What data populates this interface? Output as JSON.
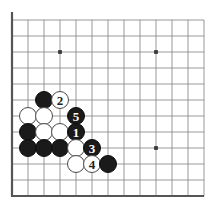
{
  "diagram": {
    "kind": "go-board-diagram",
    "board": {
      "grid_spacing": 16,
      "origin_x": 12,
      "origin_y": 20,
      "cols": 13,
      "rows": 12,
      "edges": {
        "left": true,
        "bottom": true,
        "top": false,
        "right": false
      },
      "line_color": "#8c8c8c",
      "edge_color": "#555555",
      "background": "#ffffff",
      "star_color": "#3a3a3a",
      "star_points": [
        {
          "col": 3,
          "row": 2
        },
        {
          "col": 9,
          "row": 2
        },
        {
          "col": 9,
          "row": 8
        }
      ]
    },
    "stone_radius": 9,
    "colors": {
      "black": "#1a1a1a",
      "white": "#ffffff",
      "white_outline": "#4a4a4a",
      "label_on_black": "#ffffff",
      "label_on_white": "#222222"
    },
    "stones": [
      {
        "id": "b-c2r5",
        "color": "black",
        "col": 2,
        "row": 5,
        "label": ""
      },
      {
        "id": "w-move2",
        "color": "white",
        "col": 3,
        "row": 5,
        "label": "2"
      },
      {
        "id": "w-c1r6",
        "color": "white",
        "col": 1,
        "row": 6,
        "label": ""
      },
      {
        "id": "w-c2r6",
        "color": "white",
        "col": 2,
        "row": 6,
        "label": ""
      },
      {
        "id": "b-move5",
        "color": "black",
        "col": 4,
        "row": 6,
        "label": "5"
      },
      {
        "id": "b-c1r7",
        "color": "black",
        "col": 1,
        "row": 7,
        "label": ""
      },
      {
        "id": "w-c2r7",
        "color": "white",
        "col": 2,
        "row": 7,
        "label": ""
      },
      {
        "id": "w-c3r7",
        "color": "white",
        "col": 3,
        "row": 7,
        "label": ""
      },
      {
        "id": "b-move1",
        "color": "black",
        "col": 4,
        "row": 7,
        "label": "1"
      },
      {
        "id": "b-c1r8",
        "color": "black",
        "col": 1,
        "row": 8,
        "label": ""
      },
      {
        "id": "b-c2r8",
        "color": "black",
        "col": 2,
        "row": 8,
        "label": ""
      },
      {
        "id": "b-c3r8",
        "color": "black",
        "col": 3,
        "row": 8,
        "label": ""
      },
      {
        "id": "w-c4r8",
        "color": "white",
        "col": 4,
        "row": 8,
        "label": ""
      },
      {
        "id": "b-move3",
        "color": "black",
        "col": 5,
        "row": 8,
        "label": "3"
      },
      {
        "id": "w-c4r9",
        "color": "white",
        "col": 4,
        "row": 9,
        "label": ""
      },
      {
        "id": "w-move4",
        "color": "white",
        "col": 5,
        "row": 9,
        "label": "4"
      },
      {
        "id": "b-c6r9",
        "color": "black",
        "col": 6,
        "row": 9,
        "label": ""
      }
    ],
    "move_sequence": [
      {
        "number": "1",
        "color": "black"
      },
      {
        "number": "2",
        "color": "white"
      },
      {
        "number": "3",
        "color": "black"
      },
      {
        "number": "4",
        "color": "white"
      },
      {
        "number": "5",
        "color": "black"
      }
    ]
  }
}
